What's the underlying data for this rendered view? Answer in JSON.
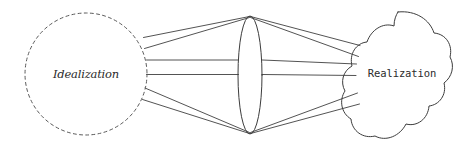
{
  "diagram": {
    "type": "concept-mapping-diagram",
    "background_color": "#ffffff",
    "stroke_color": "#3c3c3c",
    "dashed_stroke_color": "#5a5a5a",
    "nodes": {
      "left": {
        "id": "idealization",
        "label": "Idealization",
        "shape": "dashed-circle",
        "center_x": 86,
        "center_y": 74,
        "radius": 61
      },
      "middle": {
        "id": "lens",
        "label": "",
        "shape": "ellipse",
        "center_x": 250,
        "center_y": 75,
        "radius_x": 12,
        "radius_y": 59
      },
      "right": {
        "id": "realization",
        "label": "Realization",
        "shape": "blob",
        "center_x": 402,
        "center_y": 73
      }
    },
    "connector_count_left": 5,
    "connector_count_right": 5
  }
}
